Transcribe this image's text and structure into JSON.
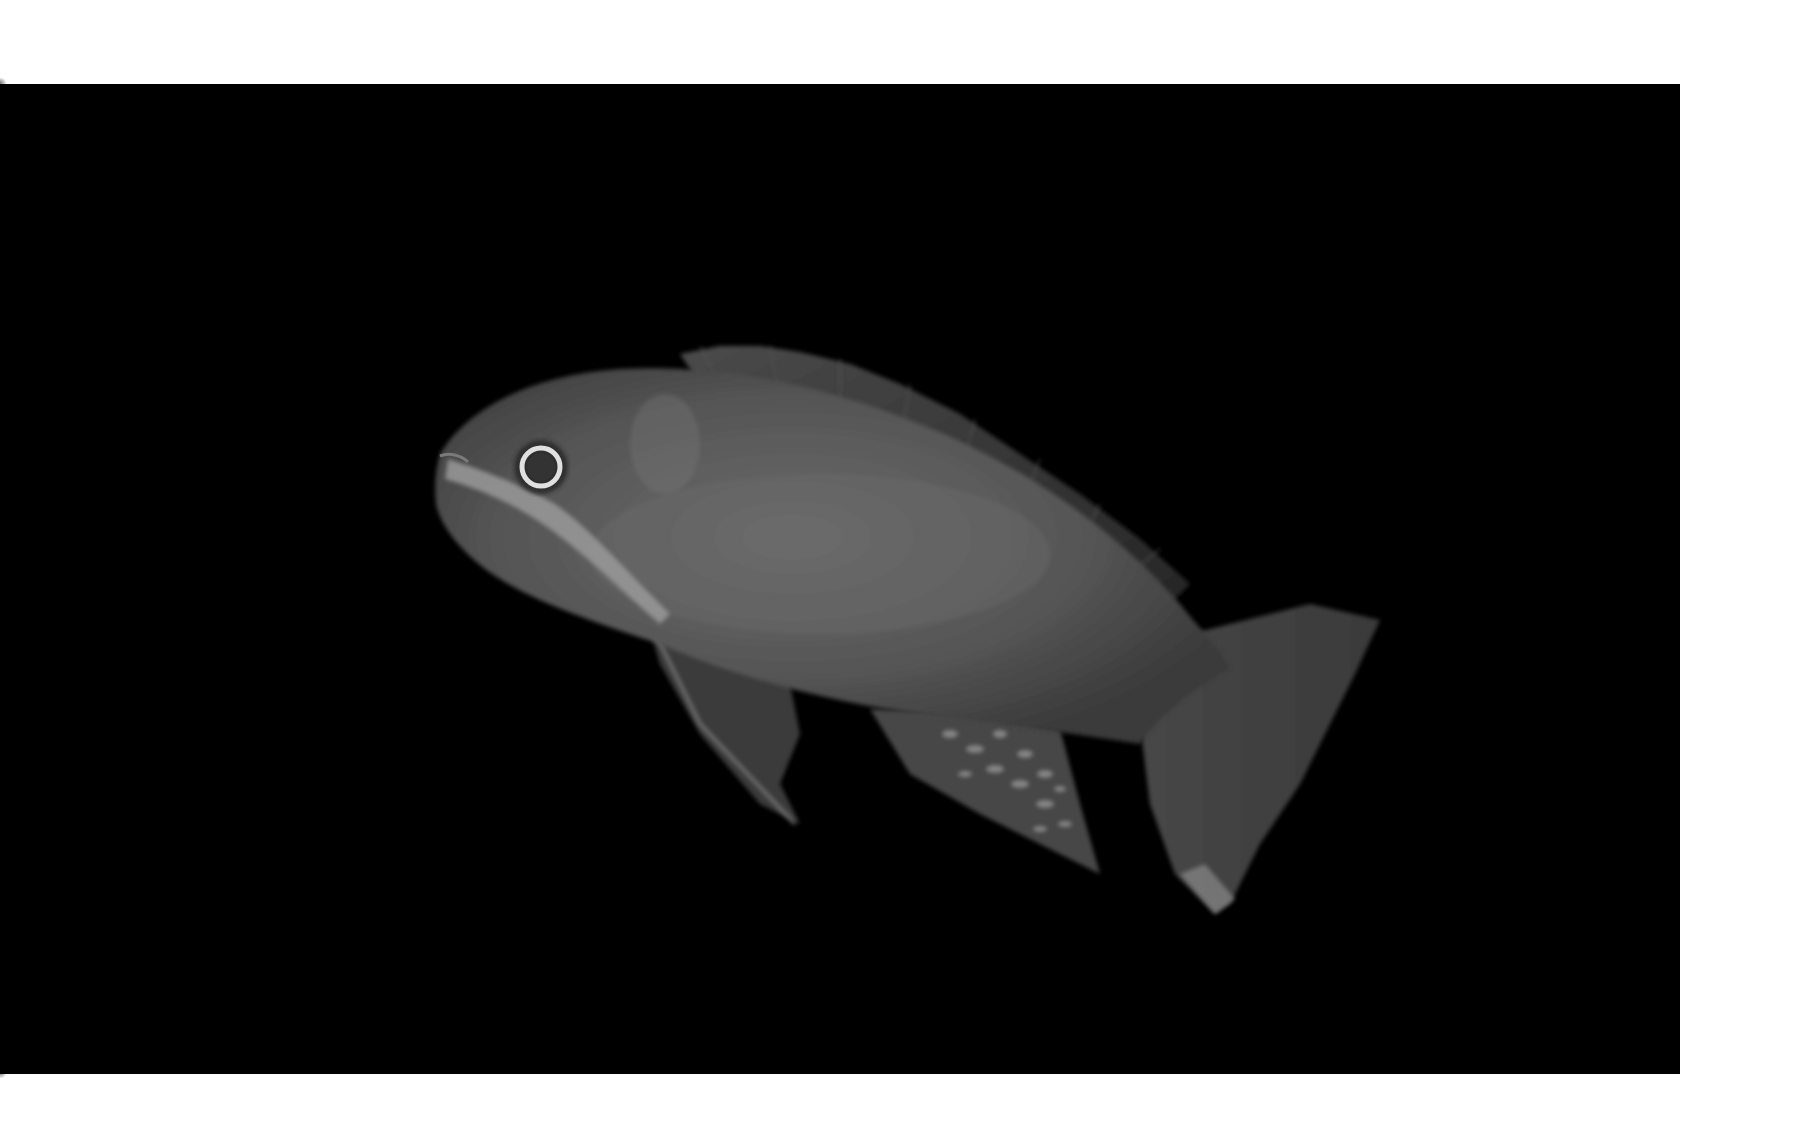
{
  "image": {
    "kind": "photograph",
    "subject": "Cichlid fish on black background",
    "description": "Grayscale studio photograph of a fish swimming to the left against a solid black background, showing a pale lateral stripe from the mouth through the eye, a long spiny dorsal fin, a pelvic fin, a spotted anal fin and a broad caudal fin.",
    "colors": {
      "page_background": "#ffffff",
      "frame_background": "#000000",
      "fish_body": "#5a5a5a",
      "fish_fins": "#3c3c3c",
      "stripe": "#9a9a9a",
      "eye_ring": "#d8d8d8"
    }
  }
}
